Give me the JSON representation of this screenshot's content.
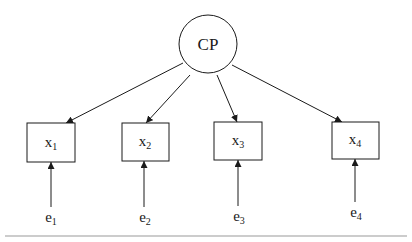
{
  "diagram": {
    "type": "structural-equation-model",
    "latent": {
      "id": "CP",
      "label": "CP",
      "cx": 208,
      "cy": 44,
      "r": 29
    },
    "indicators": [
      {
        "id": "x1",
        "base": "x",
        "sub": "1",
        "x": 27,
        "y": 123,
        "w": 48,
        "h": 39
      },
      {
        "id": "x2",
        "base": "x",
        "sub": "2",
        "x": 122,
        "y": 123,
        "w": 47,
        "h": 38
      },
      {
        "id": "x3",
        "base": "x",
        "sub": "3",
        "x": 214,
        "y": 122,
        "w": 48,
        "h": 38
      },
      {
        "id": "x4",
        "base": "x",
        "sub": "4",
        "x": 332,
        "y": 122,
        "w": 47,
        "h": 37
      }
    ],
    "errors": [
      {
        "id": "e1",
        "base": "e",
        "sub": "1",
        "target": "x1"
      },
      {
        "id": "e2",
        "base": "e",
        "sub": "2",
        "target": "x2"
      },
      {
        "id": "e3",
        "base": "e",
        "sub": "3",
        "target": "x3"
      },
      {
        "id": "e4",
        "base": "e",
        "sub": "4",
        "target": "x4"
      }
    ],
    "edges": [
      {
        "from": "CP",
        "to": "x1"
      },
      {
        "from": "CP",
        "to": "x2"
      },
      {
        "from": "CP",
        "to": "x3"
      },
      {
        "from": "CP",
        "to": "x4"
      },
      {
        "from": "e1",
        "to": "x1"
      },
      {
        "from": "e2",
        "to": "x2"
      },
      {
        "from": "e3",
        "to": "x3"
      },
      {
        "from": "e4",
        "to": "x4"
      }
    ],
    "colors": {
      "stroke": "#1a1a1a",
      "rule": "#9a9a9a",
      "background": "#ffffff"
    }
  }
}
